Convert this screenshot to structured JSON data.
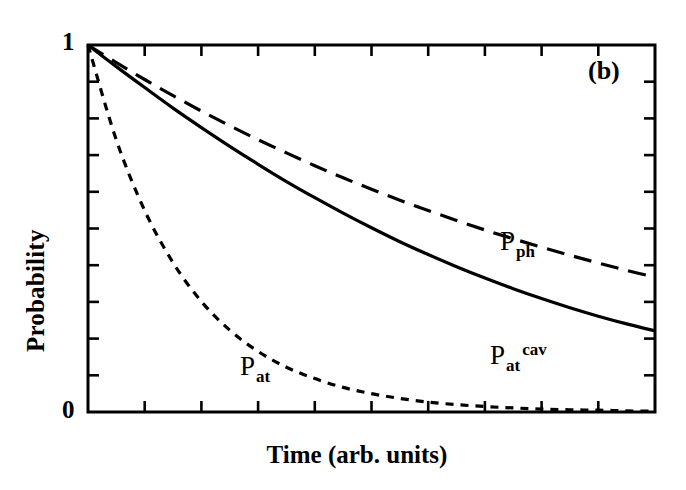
{
  "figure": {
    "panel_tag": "(b)",
    "background_color": "#ffffff",
    "ink_color": "#000000"
  },
  "axes": {
    "xlabel": "Time (arb. units)",
    "ylabel": "Probability",
    "y_tick_labels": [
      "1",
      "0"
    ],
    "x_tick_labels": []
  },
  "labels": {
    "p_ph": {
      "base": "P",
      "sub": "ph",
      "sup": ""
    },
    "p_at_cav": {
      "base": "P",
      "sub": "at",
      "sup": "cav"
    },
    "p_at": {
      "base": "P",
      "sub": "at",
      "sup": ""
    }
  },
  "chart_data": {
    "type": "line",
    "title": "",
    "subtitle": "(b)",
    "xlabel": "Time (arb. units)",
    "ylabel": "Probability",
    "xlim": [
      0,
      10
    ],
    "ylim": [
      0,
      1
    ],
    "grid": false,
    "legend": "inline-annotations",
    "x_ticks": [
      0,
      1,
      2,
      3,
      4,
      5,
      6,
      7,
      8,
      9,
      10
    ],
    "x_tick_labels": [],
    "y_ticks": [
      0,
      0.1,
      0.2,
      0.3,
      0.4,
      0.5,
      0.6,
      0.7,
      0.8,
      0.9,
      1
    ],
    "y_tick_labels": [
      "0",
      "",
      "",
      "",
      "",
      "",
      "",
      "",
      "",
      "",
      "1"
    ],
    "x": [
      0,
      0.5,
      1,
      1.5,
      2,
      2.5,
      3,
      3.5,
      4,
      4.5,
      5,
      5.5,
      6,
      6.5,
      7,
      7.5,
      8,
      8.5,
      9,
      9.5,
      10
    ],
    "series": [
      {
        "name": "P_ph",
        "label": "P_ph",
        "style": "long-dashed",
        "dash_pattern": [
          18,
          10
        ],
        "line_width": 3.2,
        "values": [
          1.0,
          0.952,
          0.906,
          0.862,
          0.82,
          0.78,
          0.742,
          0.706,
          0.671,
          0.638,
          0.607,
          0.577,
          0.549,
          0.522,
          0.496,
          0.472,
          0.449,
          0.427,
          0.406,
          0.386,
          0.367
        ]
      },
      {
        "name": "P_at_cav",
        "label": "P_at^cav",
        "style": "solid",
        "dash_pattern": [],
        "line_width": 3.2,
        "values": [
          1.0,
          0.941,
          0.884,
          0.828,
          0.775,
          0.724,
          0.675,
          0.628,
          0.584,
          0.542,
          0.502,
          0.464,
          0.429,
          0.396,
          0.365,
          0.336,
          0.309,
          0.284,
          0.261,
          0.24,
          0.221
        ]
      },
      {
        "name": "P_at",
        "label": "P_at",
        "style": "short-dashed",
        "dash_pattern": [
          8,
          7
        ],
        "line_width": 3.2,
        "values": [
          1.0,
          0.741,
          0.549,
          0.407,
          0.301,
          0.223,
          0.165,
          0.122,
          0.091,
          0.067,
          0.05,
          0.037,
          0.027,
          0.02,
          0.015,
          0.011,
          0.008,
          0.006,
          0.005,
          0.003,
          0.002
        ]
      }
    ],
    "annotations": [
      {
        "text": "P_ph",
        "x": 7.6,
        "y": 0.44
      },
      {
        "text": "P_at^cav",
        "x": 7.3,
        "y": 0.18
      },
      {
        "text": "P_at",
        "x": 2.9,
        "y": 0.16
      },
      {
        "text": "(b)",
        "x": 9.0,
        "y": 0.93
      }
    ]
  },
  "geometry": {
    "plot_left": 88,
    "plot_right": 655,
    "plot_top": 45,
    "plot_bottom": 412
  }
}
